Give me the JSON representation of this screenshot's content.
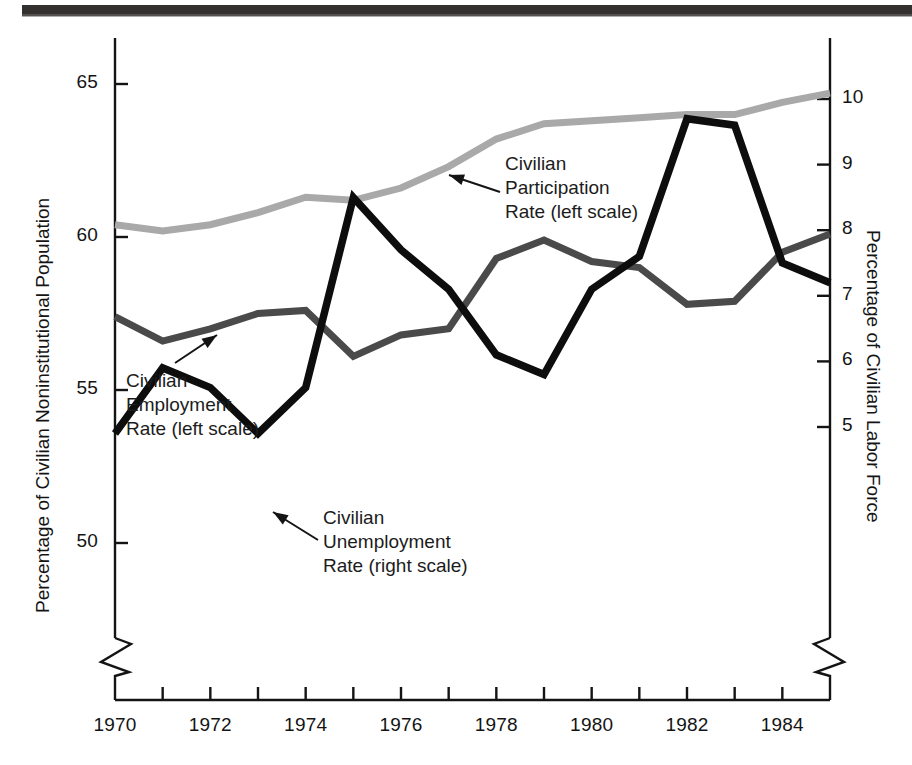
{
  "figure": {
    "background": "#ffffff",
    "rule_color": "#33312f"
  },
  "axes": {
    "left": {
      "title": "Percentage of Civilian Noninstitutional Population",
      "ticks": [
        "50",
        "55",
        "60",
        "65"
      ],
      "tick_values": [
        50,
        55,
        60,
        65
      ],
      "range": [
        48.5,
        66.0
      ],
      "broken": true
    },
    "right": {
      "title": "Percentage of Civilian Labor Force",
      "ticks": [
        "5",
        "6",
        "7",
        "8",
        "9",
        "10"
      ],
      "tick_values": [
        5,
        6,
        7,
        8,
        9,
        10
      ],
      "range": [
        3.9,
        10.6
      ],
      "broken": true
    },
    "bottom": {
      "ticks": [
        "1970",
        "1972",
        "1974",
        "1976",
        "1978",
        "1980",
        "1982",
        "1984"
      ],
      "tick_values": [
        1970,
        1972,
        1974,
        1976,
        1978,
        1980,
        1982,
        1984
      ],
      "minor_every_years": 1,
      "range": [
        1970,
        1985
      ]
    }
  },
  "annotations": {
    "participation": "Civilian\nParticipation\nRate (left scale)",
    "employment": "Civilian\nEmployment\nRate (left scale)",
    "unemployment": "Civilian\nUnemployment\nRate (right scale)"
  },
  "colors": {
    "participation": "#a9a9a9",
    "employment": "#4a4a4a",
    "unemployment": "#0d0d0d",
    "axis": "#141414"
  },
  "chart_data": {
    "type": "line",
    "title": "",
    "xlabel": "",
    "ylabel": "Percentage of Civilian Noninstitutional Population",
    "y2label": "Percentage of Civilian Labor Force",
    "x": [
      1970,
      1971,
      1972,
      1973,
      1974,
      1975,
      1976,
      1977,
      1978,
      1979,
      1980,
      1981,
      1982,
      1983,
      1984,
      1985
    ],
    "xlim": [
      1970,
      1985
    ],
    "ylim": [
      48.5,
      66.0
    ],
    "y2lim": [
      3.9,
      10.6
    ],
    "grid": false,
    "legend": "annotated-inline",
    "series": [
      {
        "name": "Civilian Participation Rate (left scale)",
        "axis": "left",
        "color": "#a9a9a9",
        "values": [
          60.4,
          60.2,
          60.4,
          60.8,
          61.3,
          61.2,
          61.6,
          62.3,
          63.2,
          63.7,
          63.8,
          63.9,
          64.0,
          64.0,
          64.4,
          64.7
        ]
      },
      {
        "name": "Civilian Employment Rate (left scale)",
        "axis": "left",
        "color": "#4a4a4a",
        "values": [
          57.4,
          56.6,
          57.0,
          57.5,
          57.6,
          56.1,
          56.8,
          57.0,
          59.3,
          59.9,
          59.2,
          59.0,
          57.8,
          57.9,
          59.5,
          60.1
        ]
      },
      {
        "name": "Civilian Unemployment Rate (right scale)",
        "axis": "right",
        "color": "#0d0d0d",
        "values": [
          4.9,
          5.9,
          5.6,
          4.9,
          5.6,
          8.5,
          7.7,
          7.1,
          6.1,
          5.8,
          7.1,
          7.6,
          9.7,
          9.6,
          7.5,
          7.2
        ]
      }
    ]
  }
}
